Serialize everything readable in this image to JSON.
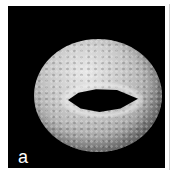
{
  "figure": {
    "panel_label": "a",
    "colors": {
      "background": "#000000",
      "grain": "#c8c8c8",
      "label": "#ffffff"
    }
  }
}
